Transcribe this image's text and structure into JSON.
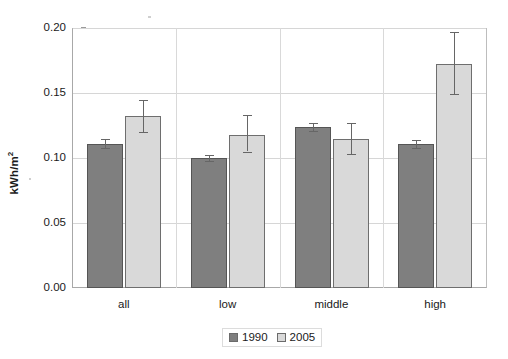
{
  "chart_data": {
    "type": "bar",
    "title": "",
    "subtitle": "",
    "xlabel": "",
    "ylabel": "kWh/m²",
    "ylabel_unit_base": "kWh/m",
    "ylabel_unit_exp": "2",
    "categories": [
      "all",
      "low",
      "middle",
      "high"
    ],
    "ylim": [
      0.0,
      0.2
    ],
    "yticks": [
      "0.00",
      "0.05",
      "0.10",
      "0.15",
      "0.20"
    ],
    "ytick_values": [
      0.0,
      0.05,
      0.1,
      0.15,
      0.2
    ],
    "grid": true,
    "legend_position": "bottom-center",
    "series": [
      {
        "name": "1990",
        "color": "#7f7f7f",
        "values": [
          0.111,
          0.1,
          0.124,
          0.111
        ],
        "errors_low": [
          0.108,
          0.098,
          0.121,
          0.108
        ],
        "errors_high": [
          0.115,
          0.102,
          0.127,
          0.114
        ]
      },
      {
        "name": "2005",
        "color": "#d9d9d9",
        "values": [
          0.132,
          0.118,
          0.115,
          0.172
        ],
        "errors_low": [
          0.12,
          0.105,
          0.103,
          0.149
        ],
        "errors_high": [
          0.145,
          0.133,
          0.127,
          0.197
        ]
      }
    ],
    "legend": [
      {
        "label": "1990",
        "color": "#7f7f7f"
      },
      {
        "label": "2005",
        "color": "#d9d9d9"
      }
    ]
  }
}
